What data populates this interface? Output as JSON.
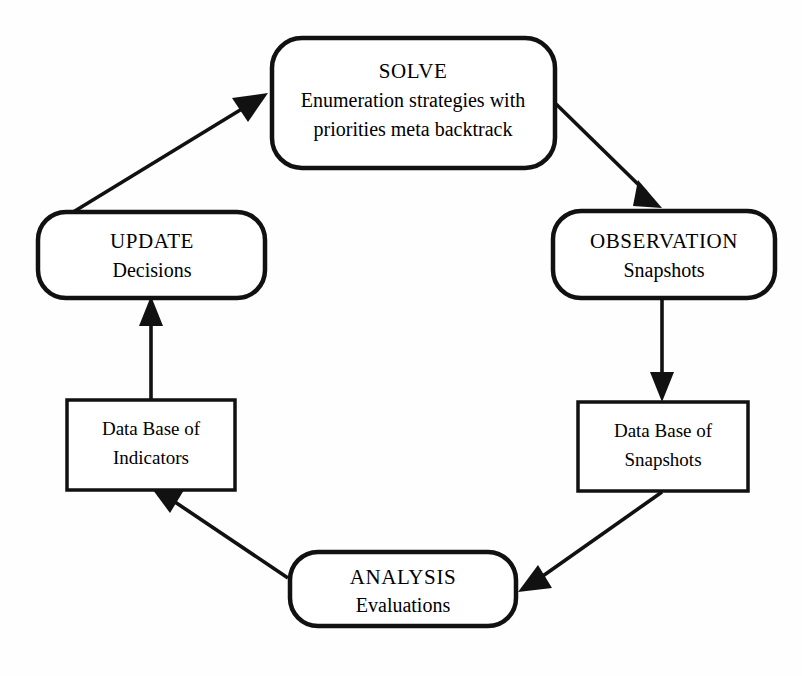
{
  "diagram": {
    "background_color": "#ffffff",
    "stroke_color": "#111111",
    "nodes": {
      "solve": {
        "id": "solve",
        "shape": "rounded-rectangle",
        "heading": "SOLVE",
        "line2": "Enumeration strategies with",
        "line3": "priorities meta backtrack"
      },
      "observation": {
        "id": "observation",
        "shape": "rounded-rectangle",
        "heading": "OBSERVATION",
        "line2": "Snapshots"
      },
      "db_snapshots": {
        "id": "db-snapshots",
        "shape": "rectangle",
        "line1": "Data Base of",
        "line2": "Snapshots"
      },
      "analysis": {
        "id": "analysis",
        "shape": "rounded-rectangle",
        "heading": "ANALYSIS",
        "line2": "Evaluations"
      },
      "db_indicators": {
        "id": "db-indicators",
        "shape": "rectangle",
        "line1": "Data Base of",
        "line2": "Indicators"
      },
      "update": {
        "id": "update",
        "shape": "rounded-rectangle",
        "heading": "UPDATE",
        "line2": "Decisions"
      }
    },
    "edges": [
      {
        "id": "solve-to-observation",
        "from": "SOLVE",
        "to": "OBSERVATION",
        "style": "solid-arrow"
      },
      {
        "id": "observation-to-db-snapshots",
        "from": "OBSERVATION",
        "to": "Data Base of Snapshots",
        "style": "solid-arrow"
      },
      {
        "id": "db-snapshots-to-analysis",
        "from": "Data Base of Snapshots",
        "to": "ANALYSIS",
        "style": "solid-arrow"
      },
      {
        "id": "analysis-to-db-indicators",
        "from": "ANALYSIS",
        "to": "Data Base of Indicators",
        "style": "solid-arrow"
      },
      {
        "id": "db-indicators-to-update",
        "from": "Data Base of Indicators",
        "to": "UPDATE",
        "style": "solid-arrow"
      },
      {
        "id": "update-to-solve",
        "from": "UPDATE",
        "to": "SOLVE",
        "style": "solid-arrow"
      }
    ]
  }
}
